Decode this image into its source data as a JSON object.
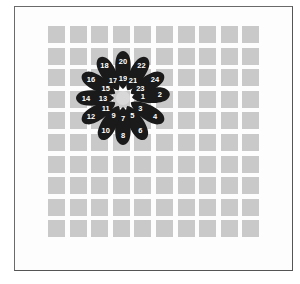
{
  "grid": {
    "rows": 10,
    "cols": 10,
    "cell_color": "#c9c9c9"
  },
  "flower": {
    "center": [
      123,
      98
    ],
    "petal_color": "#1a1a1a",
    "center_color": "#d8d8d8",
    "petals": [
      {
        "angle": -5,
        "inner": "1",
        "outer": "2"
      },
      {
        "angle": 30,
        "inner": "3",
        "outer": "4"
      },
      {
        "angle": 62,
        "inner": "5",
        "outer": "6"
      },
      {
        "angle": 90,
        "inner": "7",
        "outer": "8"
      },
      {
        "angle": 118,
        "inner": "9",
        "outer": "10"
      },
      {
        "angle": 150,
        "inner": "11",
        "outer": "12"
      },
      {
        "angle": 180,
        "inner": "13",
        "outer": "14"
      },
      {
        "angle": 210,
        "inner": "15",
        "outer": "16"
      },
      {
        "angle": 240,
        "inner": "17",
        "outer": "18"
      },
      {
        "angle": 270,
        "inner": "19",
        "outer": "20"
      },
      {
        "angle": 300,
        "inner": "21",
        "outer": "22"
      },
      {
        "angle": 330,
        "inner": "23",
        "outer": "24"
      }
    ]
  }
}
